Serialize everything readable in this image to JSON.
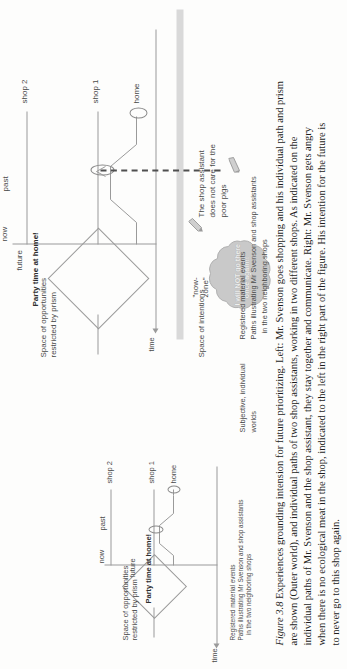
{
  "figure": {
    "number": "Figure 3.8",
    "caption_lines": [
      "Experiences grounding intension for future prioritizing. Left: Mr. Svenson goes shopping and his individual path and prism",
      "are shown (Outer world), and individual paths of two shop assistants, working in two different shops. As indicated on the",
      "individual paths of Mr. Svenson and the shop assistant, they stay together and communicate. Right: Mr. Svenson gets angry",
      "when there is no ecological meat in the shop, indicated to the left in the right part of the figure. His intention for the future is",
      "to never go to this shop again."
    ]
  },
  "left_panel": {
    "axis_time_label": "time",
    "space_of_opportunities": "Space of opportunities\nrestricted by prism",
    "party_label": "Party time at home!",
    "future_label": "future",
    "now_label": "now",
    "past_label": "past",
    "place_labels": [
      "home",
      "shop 1",
      "shop 2"
    ],
    "legend": "Registered material events\nPaths illustrating Mr Svenson and shop assistants\n   in the two neighboring shops"
  },
  "right_panel": {
    "axis_time_label": "time",
    "space_of_intentions": "Space of intentions",
    "space_of_opportunities": "Space of opportunities\nrestricted by prism",
    "party_label": "Party time at home!",
    "future_label": "future",
    "now_label": "now",
    "past_label": "past",
    "now_zone_label": "\"now-\nzone\"",
    "cloud_text": "I will NOT go there\nonce again!!",
    "annotation": "The shop assistant\ndoes not care for the\npoor pigs",
    "place_labels": [
      "home",
      "shop 1",
      "shop 2"
    ],
    "legend_top": "Registered material events\nPaths illustrating Mr Svenson and shop assistants\n   in the two neighboring shops",
    "legend_bottom": "Subjective, individual\nworlds"
  },
  "colors": {
    "stroke": "#9a9a9a",
    "text": "#4a4a4a",
    "band": "#d9d9d9",
    "cloud_fill": "#c9c9c9",
    "dash": "#4f4f4f"
  }
}
